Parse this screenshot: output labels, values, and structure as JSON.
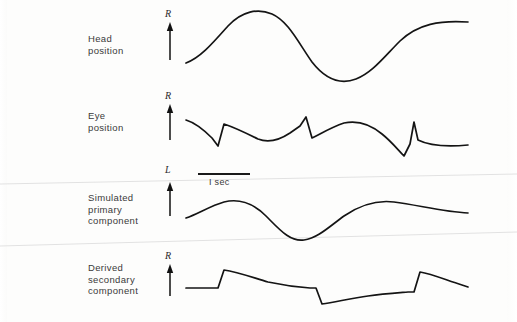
{
  "figure": {
    "background_color": "#fdfdfc",
    "trace_color": "#141414",
    "crease_color": "#e2e2e2"
  },
  "scale_bar": {
    "label": "I sec",
    "x_start": 198,
    "x_end": 250,
    "y": 174
  },
  "rows": [
    {
      "id": "head-position",
      "label": "Head\nposition",
      "direction_label": "R",
      "label_x": 88,
      "label_y": 33,
      "arrow_x": 170,
      "arrow_top": 22,
      "arrow_bottom": 60,
      "dir_label_x": 165,
      "dir_label_y": 8
    },
    {
      "id": "eye-position",
      "label": "Eye\nposition",
      "direction_label": "R",
      "label_x": 88,
      "label_y": 110,
      "arrow_x": 170,
      "arrow_top": 104,
      "arrow_bottom": 140,
      "dir_label_x": 165,
      "dir_label_y": 90
    },
    {
      "id": "simulated-primary-component",
      "label": "Simulated\nprimary\ncomponent",
      "direction_label": "L",
      "label_x": 88,
      "label_y": 192,
      "arrow_x": 170,
      "arrow_top": 182,
      "arrow_bottom": 216,
      "dir_label_x": 165,
      "dir_label_y": 164
    },
    {
      "id": "derived-secondary-component",
      "label": "Derived\nsecondary\ncomponent",
      "direction_label": "R",
      "label_x": 88,
      "label_y": 262,
      "arrow_x": 170,
      "arrow_top": 264,
      "arrow_bottom": 296,
      "dir_label_x": 165,
      "dir_label_y": 250
    }
  ],
  "chart_data": {
    "type": "line",
    "title": "",
    "xlabel": "",
    "ylabel": "",
    "legend_position": "left-labels",
    "grid": false,
    "x_scale_bar_seconds": 1,
    "series": [
      {
        "name": "Head position",
        "direction_marker": "R",
        "waveform": "sinusoid",
        "path": "M 186,63 C 200,58 212,44 228,26 C 242,11 258,8 272,14 C 288,21 298,42 312,62 C 326,80 340,85 356,79 C 372,73 384,57 400,41 C 418,24 440,20 468,22"
      },
      {
        "name": "Eye position",
        "direction_marker": "R",
        "waveform": "nystagmus-sawtooth",
        "path": "M 186,120 C 196,123 204,130 212,138 L 218,146 L 224,124 C 236,128 248,134 258,139 C 268,143 278,141 290,133 L 300,126 L 306,117 L 312,138 C 322,133 332,127 344,123 C 358,120 370,124 382,134 C 392,142 398,150 404,156 L 410,144 L 414,122 L 418,140 C 430,146 446,147 468,145"
      },
      {
        "name": "Simulated primary component",
        "direction_marker": "L",
        "waveform": "sinusoid",
        "path": "M 186,218 C 198,214 210,206 224,202 C 240,198 254,204 266,216 C 280,230 290,242 304,240 C 318,238 330,226 344,216 C 360,205 378,200 394,202 C 418,205 444,212 468,213"
      },
      {
        "name": "Derived secondary component",
        "direction_marker": "R",
        "waveform": "staircase-residual",
        "path": "M 186,288 C 196,288 204,288 212,288 L 218,288 L 224,270 C 238,272 254,278 268,282 C 282,285 296,287 310,288 L 316,288 L 322,304 C 336,302 352,298 368,296 C 382,294 396,293 408,292 L 414,292 L 420,272 C 432,274 446,280 462,285 L 468,287"
      }
    ],
    "creases": [
      {
        "x1": 0,
        "y1": 184,
        "x2": 517,
        "y2": 174
      },
      {
        "x1": 0,
        "y1": 246,
        "x2": 517,
        "y2": 232
      }
    ]
  }
}
